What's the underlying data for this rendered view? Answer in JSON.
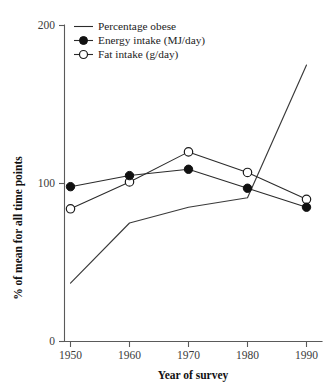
{
  "chart_data": {
    "type": "line",
    "title": "",
    "xlabel": "Year of survey",
    "ylabel": "% of mean for all time points",
    "x": [
      1950,
      1960,
      1970,
      1980,
      1990
    ],
    "xtick_labels": [
      "1950",
      "1960",
      "1970",
      "1980",
      "1990"
    ],
    "ytick_labels": [
      "0",
      "100",
      "200"
    ],
    "yticks": [
      0,
      100,
      200
    ],
    "xlim": [
      1945,
      1995
    ],
    "ylim": [
      0,
      200
    ],
    "grid": false,
    "legend_position": "top-left",
    "series": [
      {
        "name": "Percentage obese",
        "marker": "none",
        "values": [
          37,
          75,
          85,
          91,
          175
        ]
      },
      {
        "name": "Energy intake (MJ/day)",
        "marker": "filled-circle",
        "values": [
          98,
          105,
          109,
          97,
          85
        ]
      },
      {
        "name": "Fat intake (g/day)",
        "marker": "open-circle",
        "values": [
          84,
          101,
          120,
          107,
          90
        ]
      }
    ]
  },
  "legend": {
    "items": [
      {
        "label": "Percentage obese",
        "marker": "none"
      },
      {
        "label": "Energy intake (MJ/day)",
        "marker": "filled-circle"
      },
      {
        "label": "Fat intake (g/day)",
        "marker": "open-circle"
      }
    ]
  },
  "axes": {
    "x_title": "Year of survey",
    "y_title": "% of mean for all time points"
  },
  "colors": {
    "line": "#2b2b2b",
    "axis": "#5a5a5a",
    "marker_fill": "#111111",
    "marker_open_fill": "#ffffff",
    "text": "#1c1c1c",
    "background": "#ffffff"
  }
}
